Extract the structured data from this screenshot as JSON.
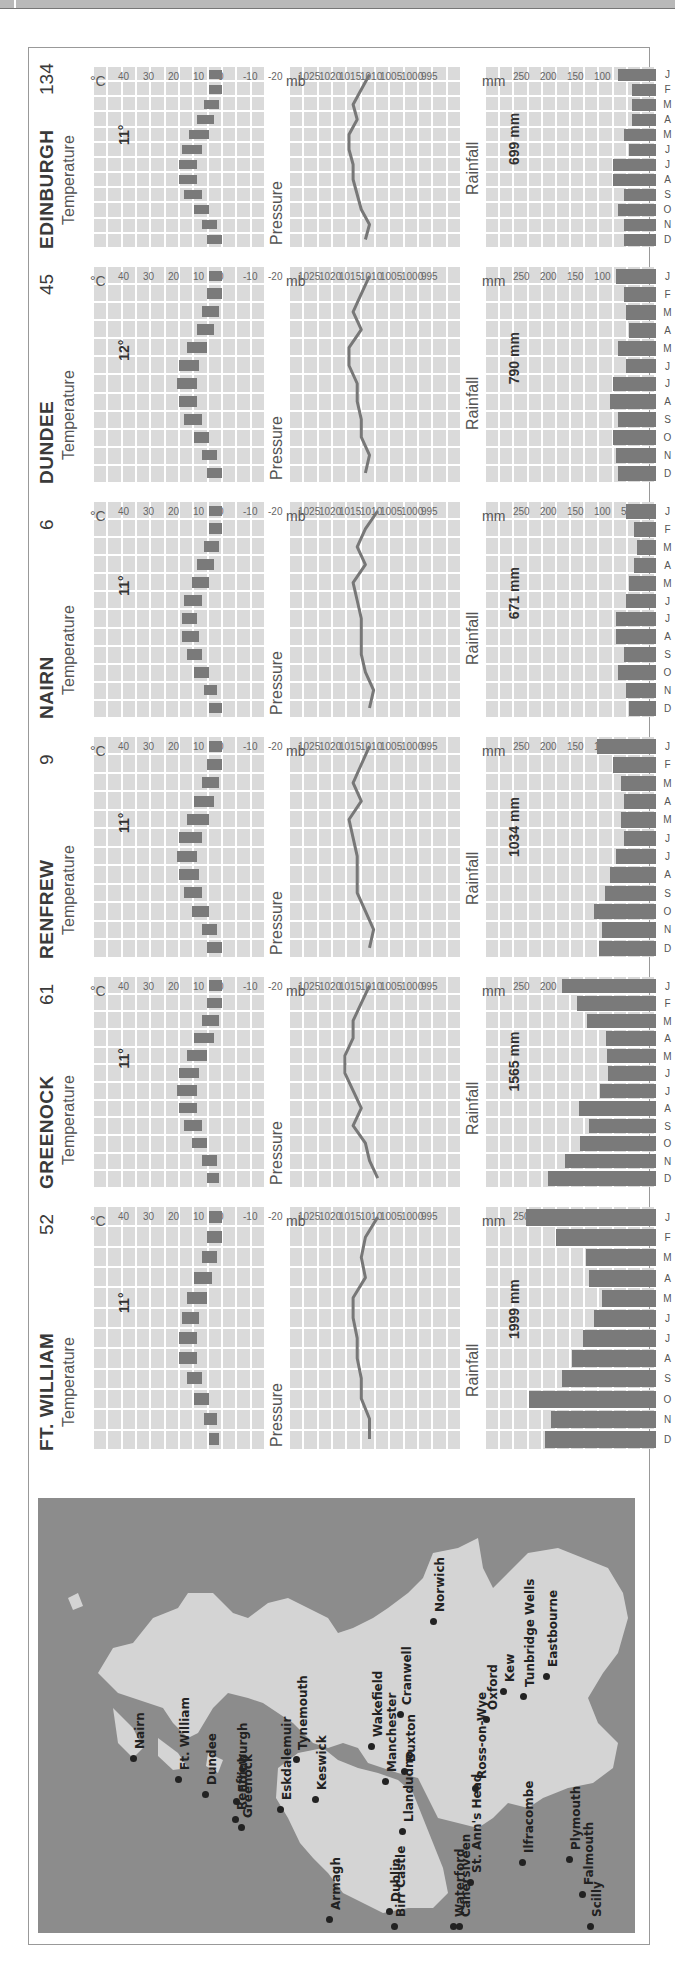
{
  "months": [
    "J",
    "F",
    "M",
    "A",
    "M",
    "J",
    "J",
    "A",
    "S",
    "O",
    "N",
    "D"
  ],
  "labels": {
    "temperature": "Temperature",
    "pressure": "Pressure",
    "rainfall": "Rainfall",
    "temp_unit": "°C",
    "pressure_unit": "mb",
    "rain_unit": "mm"
  },
  "axes": {
    "temperature_ticks": [
      "40",
      "30",
      "20",
      "10",
      "0",
      "-10",
      "-20"
    ],
    "pressure_ticks": [
      "1025",
      "1020",
      "1015",
      "1010",
      "1005",
      "1000",
      "995"
    ],
    "rainfall_ticks": [
      "250",
      "200",
      "150",
      "100",
      "50",
      "0"
    ]
  },
  "stations": [
    {
      "name": "EDINBURGH",
      "altitude": "134",
      "mean_temp": "11°",
      "annual_rain": "699 mm"
    },
    {
      "name": "DUNDEE",
      "altitude": "45",
      "mean_temp": "12°",
      "annual_rain": "790 mm"
    },
    {
      "name": "NAIRN",
      "altitude": "6",
      "mean_temp": "11°",
      "annual_rain": "671 mm"
    },
    {
      "name": "RENFREW",
      "altitude": "9",
      "mean_temp": "11°",
      "annual_rain": "1034 mm"
    },
    {
      "name": "GREENOCK",
      "altitude": "61",
      "mean_temp": "11°",
      "annual_rain": "1565 mm"
    },
    {
      "name": "FT. WILLIAM",
      "altitude": "52",
      "mean_temp": "11°",
      "annual_rain": "1999 mm"
    }
  ],
  "map": {
    "cities": [
      {
        "name": "Nairn"
      },
      {
        "name": "Ft. William"
      },
      {
        "name": "Dundee"
      },
      {
        "name": "Edinburgh"
      },
      {
        "name": "Greenock"
      },
      {
        "name": "Renfrew"
      },
      {
        "name": "Eskdalemuir"
      },
      {
        "name": "Tynemouth"
      },
      {
        "name": "Keswick"
      },
      {
        "name": "Wakefield"
      },
      {
        "name": "Cranwell"
      },
      {
        "name": "Manchester"
      },
      {
        "name": "Buxton"
      },
      {
        "name": "Llandudno"
      },
      {
        "name": "Norwich"
      },
      {
        "name": "Oxford"
      },
      {
        "name": "Kew"
      },
      {
        "name": "Ross-on-Wye"
      },
      {
        "name": "Tunbridge Wells"
      },
      {
        "name": "Eastbourne"
      },
      {
        "name": "Armagh"
      },
      {
        "name": "Dublin"
      },
      {
        "name": "St. Ann's Head"
      },
      {
        "name": "Ilfracombe"
      },
      {
        "name": "Plymouth"
      },
      {
        "name": "Birr Castle"
      },
      {
        "name": "Waterford"
      },
      {
        "name": "Cahersiveen"
      },
      {
        "name": "Falmouth"
      },
      {
        "name": "Scilly"
      }
    ]
  },
  "chart_data": [
    {
      "type": "bar",
      "title": "EDINBURGH 134",
      "categories": [
        "J",
        "F",
        "M",
        "A",
        "M",
        "J",
        "J",
        "A",
        "S",
        "O",
        "N",
        "D"
      ],
      "panels": {
        "temperature": {
          "type": "bar",
          "ylabel": "°C",
          "ylim": [
            -20,
            40
          ],
          "series": [
            {
              "name": "min",
              "values": [
                1,
                1,
                2,
                4,
                6,
                9,
                11,
                11,
                9,
                6,
                3,
                1
              ]
            },
            {
              "name": "max",
              "values": [
                6,
                6,
                8,
                11,
                14,
                17,
                18,
                18,
                16,
                12,
                9,
                7
              ]
            }
          ],
          "mean": "11°"
        },
        "pressure": {
          "type": "line",
          "ylabel": "mb",
          "ylim": [
            995,
            1025
          ],
          "values": [
            1010,
            1012,
            1014,
            1013,
            1015,
            1015,
            1014,
            1014,
            1013,
            1012,
            1010,
            1011
          ]
        },
        "rainfall": {
          "type": "bar",
          "ylabel": "mm",
          "ylim": [
            0,
            250
          ],
          "values": [
            70,
            45,
            45,
            45,
            60,
            50,
            80,
            80,
            60,
            70,
            60,
            60
          ],
          "total": "699 mm"
        }
      }
    },
    {
      "type": "bar",
      "title": "DUNDEE 45",
      "categories": [
        "J",
        "F",
        "M",
        "A",
        "M",
        "J",
        "J",
        "A",
        "S",
        "O",
        "N",
        "D"
      ],
      "panels": {
        "temperature": {
          "type": "bar",
          "ylabel": "°C",
          "ylim": [
            -20,
            40
          ],
          "series": [
            {
              "name": "min",
              "values": [
                1,
                1,
                2,
                4,
                7,
                10,
                11,
                11,
                9,
                6,
                3,
                1
              ]
            },
            {
              "name": "max",
              "values": [
                6,
                7,
                9,
                11,
                15,
                18,
                19,
                18,
                16,
                12,
                9,
                7
              ]
            }
          ],
          "mean": "12°"
        },
        "pressure": {
          "type": "line",
          "ylabel": "mb",
          "ylim": [
            995,
            1025
          ],
          "values": [
            1010,
            1012,
            1014,
            1012,
            1015,
            1015,
            1013,
            1013,
            1012,
            1012,
            1010,
            1011
          ]
        },
        "rainfall": {
          "type": "bar",
          "ylabel": "mm",
          "ylim": [
            0,
            250
          ],
          "values": [
            75,
            60,
            55,
            50,
            70,
            55,
            80,
            85,
            70,
            80,
            75,
            70
          ],
          "total": "790 mm"
        }
      }
    },
    {
      "type": "bar",
      "title": "NAIRN 6",
      "categories": [
        "J",
        "F",
        "M",
        "A",
        "M",
        "J",
        "J",
        "A",
        "S",
        "O",
        "N",
        "D"
      ],
      "panels": {
        "temperature": {
          "type": "bar",
          "ylabel": "°C",
          "ylim": [
            -20,
            40
          ],
          "series": [
            {
              "name": "min",
              "values": [
                1,
                1,
                2,
                4,
                6,
                9,
                11,
                10,
                9,
                6,
                3,
                1
              ]
            },
            {
              "name": "max",
              "values": [
                6,
                6,
                8,
                11,
                13,
                16,
                17,
                17,
                15,
                12,
                8,
                6
              ]
            }
          ],
          "mean": "11°"
        },
        "pressure": {
          "type": "line",
          "ylabel": "mb",
          "ylim": [
            995,
            1025
          ],
          "values": [
            1008,
            1011,
            1013,
            1011,
            1014,
            1013,
            1012,
            1012,
            1012,
            1011,
            1009,
            1010
          ]
        },
        "rainfall": {
          "type": "bar",
          "ylabel": "mm",
          "ylim": [
            0,
            250
          ],
          "values": [
            55,
            40,
            35,
            40,
            50,
            55,
            75,
            75,
            60,
            70,
            55,
            50
          ],
          "total": "671 mm"
        }
      }
    },
    {
      "type": "bar",
      "title": "RENFREW 9",
      "categories": [
        "J",
        "F",
        "M",
        "A",
        "M",
        "J",
        "J",
        "A",
        "S",
        "O",
        "N",
        "D"
      ],
      "panels": {
        "temperature": {
          "type": "bar",
          "ylabel": "°C",
          "ylim": [
            -20,
            40
          ],
          "series": [
            {
              "name": "min",
              "values": [
                1,
                1,
                2,
                4,
                6,
                9,
                11,
                10,
                9,
                6,
                3,
                1
              ]
            },
            {
              "name": "max",
              "values": [
                6,
                7,
                9,
                12,
                15,
                18,
                19,
                18,
                16,
                13,
                9,
                7
              ]
            }
          ],
          "mean": "11°"
        },
        "pressure": {
          "type": "line",
          "ylabel": "mb",
          "ylim": [
            995,
            1025
          ],
          "values": [
            1010,
            1012,
            1014,
            1012,
            1015,
            1014,
            1013,
            1013,
            1013,
            1011,
            1009,
            1010
          ]
        },
        "rainfall": {
          "type": "bar",
          "ylabel": "mm",
          "ylim": [
            0,
            250
          ],
          "values": [
            110,
            80,
            65,
            60,
            65,
            60,
            75,
            85,
            95,
            115,
            100,
            105
          ],
          "total": "1034 mm"
        }
      }
    },
    {
      "type": "bar",
      "title": "GREENOCK 61",
      "categories": [
        "J",
        "F",
        "M",
        "A",
        "M",
        "J",
        "J",
        "A",
        "S",
        "O",
        "N",
        "D"
      ],
      "panels": {
        "temperature": {
          "type": "bar",
          "ylabel": "°C",
          "ylim": [
            -20,
            40
          ],
          "series": [
            {
              "name": "min",
              "values": [
                1,
                1,
                2,
                4,
                7,
                10,
                11,
                11,
                9,
                7,
                3,
                2
              ]
            },
            {
              "name": "max",
              "values": [
                6,
                7,
                9,
                12,
                15,
                18,
                19,
                18,
                16,
                13,
                9,
                7
              ]
            }
          ],
          "mean": "11°"
        },
        "pressure": {
          "type": "line",
          "ylabel": "mb",
          "ylim": [
            995,
            1025
          ],
          "values": [
            1010,
            1012,
            1014,
            1014,
            1016,
            1016,
            1014,
            1012,
            1014,
            1011,
            1010,
            1008
          ]
        },
        "rainfall": {
          "type": "bar",
          "ylabel": "mm",
          "ylim": [
            0,
            250
          ],
          "values": [
            175,
            146,
            127,
            93,
            90,
            88,
            103,
            142,
            125,
            140,
            168,
            200
          ],
          "total": "1565 mm"
        }
      }
    },
    {
      "type": "bar",
      "title": "FT. WILLIAM 52",
      "categories": [
        "J",
        "F",
        "M",
        "A",
        "M",
        "J",
        "J",
        "A",
        "S",
        "O",
        "N",
        "D"
      ],
      "panels": {
        "temperature": {
          "type": "bar",
          "ylabel": "°C",
          "ylim": [
            -20,
            40
          ],
          "series": [
            {
              "name": "min",
              "values": [
                1,
                1,
                3,
                5,
                7,
                10,
                11,
                11,
                9,
                6,
                3,
                2
              ]
            },
            {
              "name": "max",
              "values": [
                6,
                7,
                9,
                12,
                15,
                17,
                18,
                18,
                15,
                12,
                8,
                6
              ]
            }
          ],
          "mean": "11°"
        },
        "pressure": {
          "type": "line",
          "ylabel": "mb",
          "ylim": [
            995,
            1025
          ],
          "values": [
            1008,
            1011,
            1012,
            1011,
            1014,
            1014,
            1013,
            1013,
            1012,
            1012,
            1010,
            1010
          ]
        },
        "rainfall": {
          "type": "bar",
          "ylabel": "mm",
          "ylim": [
            0,
            250
          ],
          "values": [
            240,
            185,
            130,
            125,
            100,
            115,
            135,
            155,
            175,
            235,
            195,
            205
          ],
          "total": "1999 mm"
        }
      }
    }
  ]
}
